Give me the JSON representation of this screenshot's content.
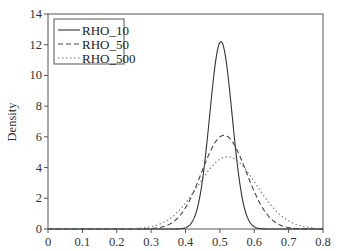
{
  "chart_data": {
    "type": "line",
    "title": "",
    "xlabel": "",
    "ylabel": "Density",
    "xlim": [
      0,
      0.8
    ],
    "ylim": [
      0,
      14
    ],
    "x_ticks": [
      "0",
      "0.1",
      "0.2",
      "0.3",
      "0.4",
      "0.5",
      "0.6",
      "0.7",
      "0.8"
    ],
    "y_ticks": [
      "0",
      "2",
      "4",
      "6",
      "8",
      "10",
      "12",
      "14"
    ],
    "grid": false,
    "legend_position": "upper left",
    "series": [
      {
        "name": "RHO_10",
        "style": "solid",
        "color": "#333333",
        "shape": "approx-normal",
        "mean": 0.503,
        "sd": 0.0327,
        "peak": 12.2,
        "x": [
          0.36,
          0.38,
          0.4,
          0.42,
          0.44,
          0.46,
          0.48,
          0.5,
          0.52,
          0.54,
          0.56,
          0.58,
          0.6,
          0.62,
          0.64
        ],
        "y": [
          0.0,
          0.01,
          0.09,
          0.49,
          1.91,
          5.14,
          9.53,
          12.15,
          10.66,
          6.43,
          2.67,
          0.76,
          0.15,
          0.02,
          0.0
        ]
      },
      {
        "name": "RHO_50",
        "style": "dashed",
        "color": "#444444",
        "shape": "approx-normal",
        "mean": 0.512,
        "sd": 0.065,
        "peak": 6.1,
        "x": [
          0.2,
          0.26,
          0.3,
          0.34,
          0.38,
          0.42,
          0.46,
          0.5,
          0.54,
          0.58,
          0.62,
          0.66,
          0.7,
          0.74
        ],
        "y": [
          0.0,
          0.0,
          0.03,
          0.18,
          0.78,
          2.24,
          4.43,
          6.0,
          5.56,
          3.53,
          1.54,
          0.46,
          0.09,
          0.01
        ]
      },
      {
        "name": "RHO_500",
        "style": "dotted",
        "color": "#777777",
        "shape": "approx-normal",
        "mean": 0.522,
        "sd": 0.085,
        "peak": 4.7,
        "x": [
          0.18,
          0.24,
          0.3,
          0.34,
          0.38,
          0.42,
          0.46,
          0.5,
          0.52,
          0.56,
          0.6,
          0.64,
          0.68,
          0.72,
          0.76
        ],
        "y": [
          0.0,
          0.02,
          0.15,
          0.46,
          1.17,
          2.36,
          3.8,
          4.6,
          4.7,
          4.2,
          3.07,
          1.71,
          0.74,
          0.29,
          0.06
        ]
      }
    ]
  }
}
